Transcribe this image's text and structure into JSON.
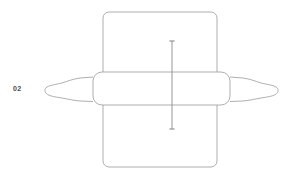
{
  "canvas": {
    "width": 287,
    "height": 178,
    "background_color": "#ffffff"
  },
  "label": {
    "step_number": "02",
    "color": "#4a4a4a"
  },
  "illustration": {
    "name": "rolling-pin-over-dough-diagram",
    "stroke_color": "#9a9a9a",
    "fill_color": "#ffffff",
    "stroke_width": "0.8",
    "parts": [
      {
        "name": "dough-sheet",
        "shape": "rounded-rectangle",
        "x": 103,
        "y": 12,
        "width": 114,
        "height": 155,
        "corner_radius": 6
      },
      {
        "name": "rolling-pin-barrel",
        "shape": "rounded-rectangle",
        "x": 93,
        "y": 72,
        "width": 137,
        "height": 33,
        "corner_radius": 9
      },
      {
        "name": "rolling-pin-handle-left",
        "shape": "knob-with-neck",
        "side": "left"
      },
      {
        "name": "rolling-pin-handle-right",
        "shape": "knob-with-neck",
        "side": "right"
      },
      {
        "name": "dimension-line-vertical",
        "x": 172,
        "y_top": 41,
        "y_bottom": 129,
        "cap_half_width": 2.6
      }
    ]
  }
}
